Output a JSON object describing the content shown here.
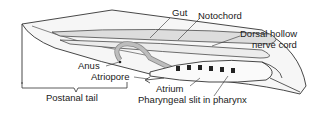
{
  "diagram": {
    "labels": {
      "gut": "Gut",
      "notochord": "Notochord",
      "dorsal_line1": "Dorsal hollow",
      "dorsal_line2": "nerve cord",
      "anus": "Anus",
      "atriopore": "Atriopore",
      "atrium": "Atrium",
      "pharyngeal_slit": "Pharyngeal slit in pharynx",
      "postanal_tail": "Postanal tail"
    },
    "colors": {
      "line": "#333333",
      "fill_body": "#f4f4f4",
      "fill_gut": "#cccccc",
      "text": "#1a1a1a"
    }
  }
}
